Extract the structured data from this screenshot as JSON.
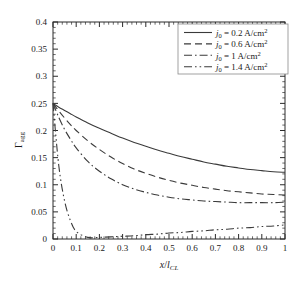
{
  "chart_data": {
    "type": "line",
    "title": "",
    "xlabel": "x/l_CL",
    "ylabel": "Γ_agg",
    "xlim": [
      0,
      1
    ],
    "ylim": [
      0,
      0.4
    ],
    "grid": false,
    "legend_position": "upper right",
    "x_ticks": [
      "0",
      "0.1",
      "0.2",
      "0.3",
      "0.4",
      "0.5",
      "0.6",
      "0.7",
      "0.8",
      "0.9",
      "1"
    ],
    "x_tick_values": [
      0,
      0.1,
      0.2,
      0.3,
      0.4,
      0.5,
      0.6,
      0.7,
      0.8,
      0.9,
      1
    ],
    "y_ticks": [
      "0",
      "0.05",
      "0.1",
      "0.15",
      "0.2",
      "0.25",
      "0.3",
      "0.35",
      "0.4"
    ],
    "y_tick_values": [
      0,
      0.05,
      0.1,
      0.15,
      0.2,
      0.25,
      0.3,
      0.35,
      0.4
    ],
    "x": [
      0,
      0.025,
      0.05,
      0.075,
      0.1,
      0.15,
      0.2,
      0.25,
      0.3,
      0.35,
      0.4,
      0.45,
      0.5,
      0.55,
      0.6,
      0.65,
      0.7,
      0.75,
      0.8,
      0.85,
      0.9,
      0.95,
      1
    ],
    "series": [
      {
        "name": "j0 = 0.2 A/cm2",
        "label_symbol": "j",
        "label_subscript": "0",
        "label_value": "0.2",
        "label_units": "A/cm",
        "label_units_exponent": "2",
        "style": "solid",
        "color": "#3a3a3a",
        "values": [
          0.25,
          0.243,
          0.237,
          0.231,
          0.225,
          0.214,
          0.204,
          0.195,
          0.186,
          0.178,
          0.171,
          0.164,
          0.158,
          0.152,
          0.147,
          0.142,
          0.138,
          0.134,
          0.131,
          0.128,
          0.126,
          0.124,
          0.123
        ]
      },
      {
        "name": "j0 = 0.6 A/cm2",
        "label_symbol": "j",
        "label_subscript": "0",
        "label_value": "0.6",
        "label_units": "A/cm",
        "label_units_exponent": "2",
        "style": "dashed",
        "color": "#3a3a3a",
        "values": [
          0.25,
          0.236,
          0.223,
          0.211,
          0.2,
          0.181,
          0.165,
          0.151,
          0.139,
          0.129,
          0.121,
          0.114,
          0.108,
          0.103,
          0.099,
          0.095,
          0.092,
          0.089,
          0.087,
          0.085,
          0.083,
          0.082,
          0.081
        ]
      },
      {
        "name": "j0 = 1 A/cm2",
        "label_symbol": "j",
        "label_subscript": "0",
        "label_value": "1",
        "label_units": "A/cm",
        "label_units_exponent": "2",
        "style": "dashdot",
        "color": "#3a3a3a",
        "values": [
          0.25,
          0.224,
          0.202,
          0.184,
          0.168,
          0.143,
          0.125,
          0.111,
          0.1,
          0.092,
          0.086,
          0.081,
          0.077,
          0.074,
          0.072,
          0.07,
          0.069,
          0.068,
          0.067,
          0.067,
          0.067,
          0.067,
          0.068
        ]
      },
      {
        "name": "j0 = 1.4 A/cm2",
        "label_symbol": "j",
        "label_subscript": "0",
        "label_value": "1.4",
        "label_units": "A/cm",
        "label_units_exponent": "2",
        "style": "dashdotdot",
        "color": "#3a3a3a",
        "values": [
          0.25,
          0.135,
          0.07,
          0.034,
          0.014,
          0.003,
          0.003,
          0.004,
          0.005,
          0.006,
          0.008,
          0.009,
          0.011,
          0.012,
          0.014,
          0.015,
          0.017,
          0.018,
          0.02,
          0.021,
          0.023,
          0.024,
          0.026
        ]
      }
    ]
  },
  "axes": {
    "ylabel_symbol": "Γ",
    "ylabel_subscript": "agg",
    "xlabel_numerator": "x",
    "xlabel_slash": "/",
    "xlabel_denominator": "l",
    "xlabel_denominator_subscript": "CL"
  },
  "colors": {
    "axis": "#2b2b2b",
    "curve": "#3a3a3a",
    "legend_border": "#8a8a8a",
    "background": "#ffffff"
  }
}
